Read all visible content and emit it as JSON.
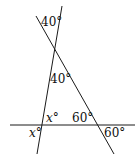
{
  "diagram": {
    "type": "geometry",
    "lines": [
      {
        "name": "line-a",
        "x1": 62,
        "y1": 6,
        "x2": 37,
        "y2": 154
      },
      {
        "name": "line-b",
        "x1": 36,
        "y1": 16,
        "x2": 114,
        "y2": 154
      },
      {
        "name": "horizontal-line",
        "x1": 10,
        "y1": 125,
        "x2": 135,
        "y2": 125
      }
    ],
    "labels": {
      "top_angle": "40°",
      "apex_angle": "40°",
      "x_upper": "x°",
      "x_lower": "x°",
      "base_inner_angle": "60°",
      "base_outer_angle": "60°"
    },
    "stroke_color": "#1a1a1a"
  }
}
